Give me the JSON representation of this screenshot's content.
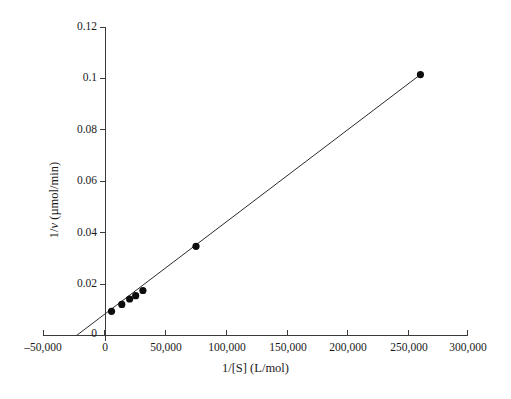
{
  "chart_data": {
    "type": "scatter",
    "title": "",
    "subtitle": "",
    "xlabel": "1/[S] (L/mol)",
    "ylabel": "1/v (µmol/min)",
    "xlabel_parts": {
      "pre": "1/[S] (L/mol)"
    },
    "ylabel_parts": {
      "pre": "1/",
      "italic": "v",
      "post": " (µmol/min)"
    },
    "xlim": [
      -50000,
      300000
    ],
    "ylim": [
      0,
      0.12
    ],
    "xticks": [
      -50000,
      0,
      50000,
      100000,
      150000,
      200000,
      250000,
      300000
    ],
    "xtick_labels": [
      "–50,000",
      "0",
      "50,000",
      "100,000",
      "150,000",
      "200,000",
      "250,000",
      "300,000"
    ],
    "yticks": [
      0,
      0.02,
      0.04,
      0.06,
      0.08,
      0.1,
      0.12
    ],
    "ytick_labels": [
      "0",
      "0.02",
      "0.04",
      "0.06",
      "0.08",
      "0.1",
      "0.12"
    ],
    "grid": false,
    "legend": false,
    "series": [
      {
        "name": "Lineweaver–Burk data",
        "marker": "filled-circle",
        "marker_color": "#0d0d0d",
        "points": [
          {
            "x": 5000,
            "y": 0.0094
          },
          {
            "x": 13500,
            "y": 0.0121
          },
          {
            "x": 20000,
            "y": 0.0142
          },
          {
            "x": 25000,
            "y": 0.0155
          },
          {
            "x": 31000,
            "y": 0.0175
          },
          {
            "x": 75000,
            "y": 0.0347
          },
          {
            "x": 261000,
            "y": 0.1015
          }
        ]
      }
    ],
    "fit_line": {
      "name": "least-squares fit",
      "color": "#2b2b2b",
      "x_start": -24000,
      "y_start": 0,
      "x_end": 261000,
      "y_end": 0.1015,
      "x_intercept": -24000,
      "y_intercept": 0.00825,
      "slope_per_unit_x": 3.45e-07
    }
  },
  "axes": {
    "x_axis_name": "x-axis",
    "y_axis_name": "y-axis"
  }
}
